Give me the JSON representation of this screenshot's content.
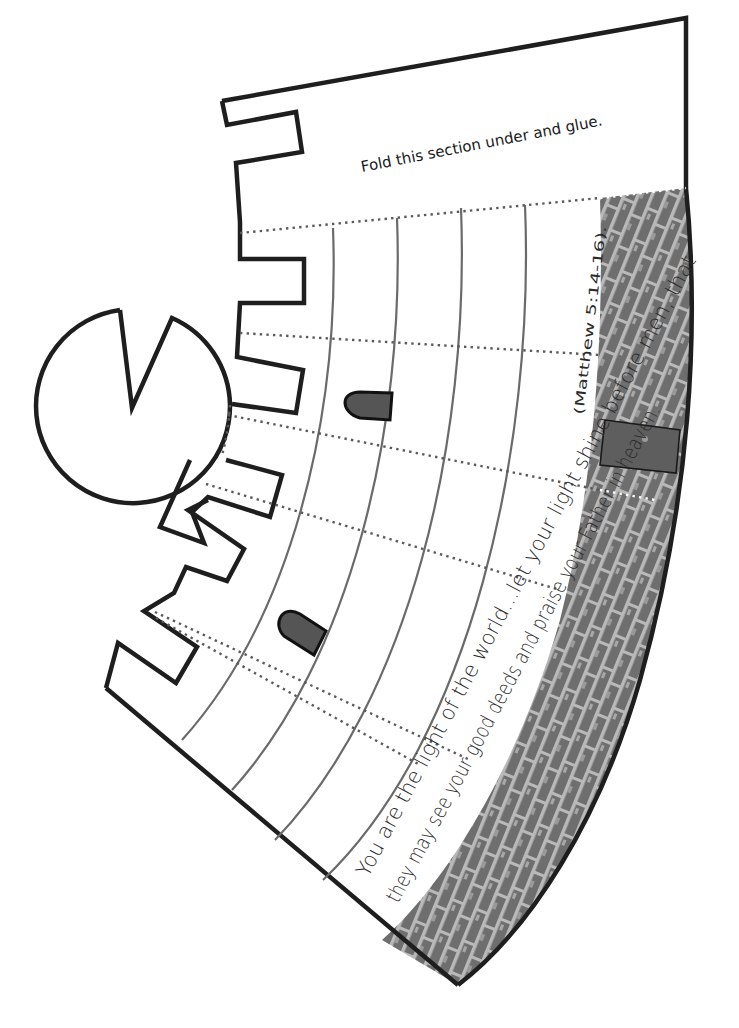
{
  "template": {
    "glue_flap_instruction": "Fold this section under and glue.",
    "verse_line_1": "You are the light of the world...let your light shine before men, that",
    "verse_line_2_main": "they may see your good deeds and praise your Father in heaven.",
    "verse_reference": "(Matthew 5:14-16)."
  },
  "shapes": {
    "tower_body": "annular-sector",
    "battlements": "crenellations",
    "roof_circle": "circle-with-notch",
    "windows": 2,
    "door": 1,
    "wall_texture": "brick"
  },
  "colors": {
    "outline": "#1e1e1e",
    "guide_lines": "#6a6a6a",
    "fold_lines": "#5a5a5a",
    "brick_mortar": "#b9b9b9",
    "brick_fill": "#6e6e6e",
    "window_fill": "#555555",
    "door_fill": "#5e5e5e"
  }
}
